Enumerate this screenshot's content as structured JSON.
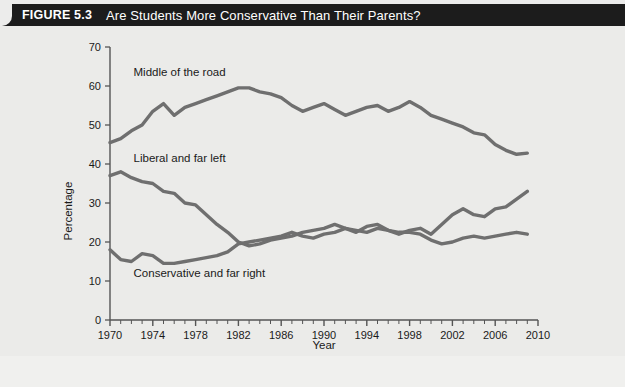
{
  "figure": {
    "number": "FIGURE 5.3",
    "title": "Are Students More Conservative Than Their Parents?"
  },
  "colors": {
    "header_bg": "#1c1c1c",
    "header_text": "#ffffff",
    "panel_bg": "#ebebe9",
    "line": "#6f6f6f",
    "axis": "#555555",
    "label_text": "#1a1a1a"
  },
  "chart_data": {
    "type": "line",
    "title": "Are Students More Conservative Than Their Parents?",
    "xlabel": "Year",
    "ylabel": "Percentage",
    "xlim": [
      1970,
      2010
    ],
    "ylim": [
      0,
      70
    ],
    "ytick_values": [
      0,
      10,
      20,
      30,
      40,
      50,
      60,
      70
    ],
    "ytick_labels": [
      "0",
      "10",
      "20",
      "30",
      "40",
      "50",
      "60",
      "70"
    ],
    "xtick_labels": [
      "1970",
      "1974",
      "1978",
      "1982",
      "1986",
      "1990",
      "1994",
      "1998",
      "2002",
      "2006",
      "2010"
    ],
    "xtick_values": [
      1970,
      1974,
      1978,
      1982,
      1986,
      1990,
      1994,
      1998,
      2002,
      2006,
      2010
    ],
    "minor_xticks_every": 1,
    "grid": false,
    "legend": "inline-annotations",
    "x": [
      1970,
      1971,
      1972,
      1973,
      1974,
      1975,
      1976,
      1977,
      1978,
      1979,
      1980,
      1981,
      1982,
      1983,
      1984,
      1985,
      1986,
      1987,
      1988,
      1989,
      1990,
      1991,
      1992,
      1993,
      1994,
      1995,
      1996,
      1997,
      1998,
      1999,
      2000,
      2001,
      2002,
      2003,
      2004,
      2005,
      2006,
      2007,
      2008,
      2009
    ],
    "series": [
      {
        "name": "Middle of the road",
        "label_x": 1972.2,
        "label_y": 62.5,
        "values": [
          45.5,
          46.5,
          48.5,
          50.0,
          53.5,
          55.5,
          52.5,
          54.5,
          55.5,
          56.5,
          57.5,
          58.5,
          59.5,
          59.5,
          58.5,
          58.0,
          57.0,
          55.0,
          53.5,
          54.5,
          55.5,
          54.0,
          52.5,
          53.5,
          54.5,
          55.0,
          53.5,
          54.5,
          56.0,
          54.5,
          52.5,
          51.5,
          50.5,
          49.5,
          48.0,
          47.5,
          45.0,
          43.5,
          42.5,
          42.8
        ]
      },
      {
        "name": "Liberal and far left",
        "label_x": 1972.2,
        "label_y": 40.5,
        "values": [
          37.0,
          38.0,
          36.5,
          35.5,
          35.0,
          33.0,
          32.5,
          30.0,
          29.5,
          27.0,
          24.5,
          22.5,
          20.0,
          19.0,
          19.5,
          20.5,
          21.0,
          21.5,
          22.5,
          23.0,
          23.5,
          24.5,
          23.5,
          22.5,
          24.0,
          24.5,
          23.0,
          22.0,
          23.0,
          23.5,
          22.0,
          24.5,
          27.0,
          28.5,
          27.0,
          26.5,
          28.5,
          29.0,
          31.0,
          33.0
        ]
      },
      {
        "name": "Conservative and far right",
        "label_x": 1972.2,
        "label_y": 11.0,
        "values": [
          18.0,
          15.5,
          15.0,
          17.0,
          16.5,
          14.5,
          14.5,
          15.0,
          15.5,
          16.0,
          16.5,
          17.5,
          19.5,
          20.0,
          20.5,
          21.0,
          21.5,
          22.5,
          21.5,
          21.0,
          22.0,
          22.5,
          23.5,
          23.0,
          22.5,
          23.5,
          23.0,
          22.5,
          22.5,
          22.0,
          20.5,
          19.5,
          20.0,
          21.0,
          21.5,
          21.0,
          21.5,
          22.0,
          22.5,
          22.0
        ]
      }
    ]
  }
}
